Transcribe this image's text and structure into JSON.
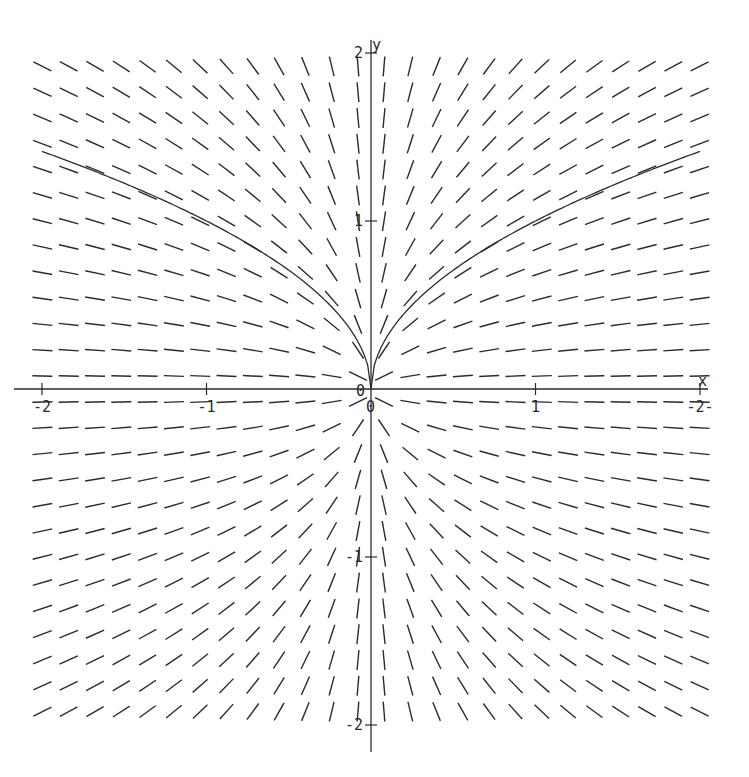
{
  "chart_data": {
    "type": "slope_field",
    "title": "",
    "xlabel": "x",
    "ylabel": "y",
    "xlim": [
      -2,
      2
    ],
    "ylim": [
      -2,
      2
    ],
    "grid": false,
    "equation": "dy/dx = y/(2x)",
    "solution_curve": "y = sqrt(|x|)",
    "x_ticks": [
      {
        "value": -2,
        "label": "-2"
      },
      {
        "value": -1,
        "label": "-1"
      },
      {
        "value": 0,
        "label": "0"
      },
      {
        "value": 1,
        "label": "1"
      },
      {
        "value": 2,
        "label": "-2-"
      }
    ],
    "y_ticks": [
      {
        "value": 2,
        "label": "2"
      },
      {
        "value": 1,
        "label": "1"
      },
      {
        "value": -1,
        "label": "-1"
      },
      {
        "value": -2,
        "label": "-2"
      }
    ],
    "origin_labels": [
      "0",
      "0"
    ],
    "field_columns": 26,
    "field_rows": 26,
    "solution_samples": [
      {
        "x": -2,
        "y": 1.41
      },
      {
        "x": -1,
        "y": 1.0
      },
      {
        "x": -0.5,
        "y": 0.71
      },
      {
        "x": -0.1,
        "y": 0.32
      },
      {
        "x": 0,
        "y": 0
      },
      {
        "x": 0.1,
        "y": 0.32
      },
      {
        "x": 0.5,
        "y": 0.71
      },
      {
        "x": 1,
        "y": 1.0
      },
      {
        "x": 2,
        "y": 1.41
      }
    ]
  },
  "colors": {
    "ink": "#2b2b2b",
    "background": "#ffffff"
  }
}
